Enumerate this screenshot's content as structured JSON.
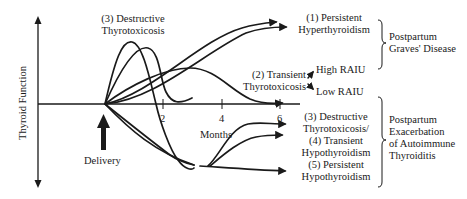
{
  "axes": {
    "y_label": "Thyroid Function",
    "x_label": "Months",
    "x_ticks": [
      "2",
      "4",
      "6"
    ],
    "event_label": "Delivery"
  },
  "curves": [
    {
      "id": "1",
      "label_line1": "(1) Persistent",
      "label_line2": "Hyperthyroidism"
    },
    {
      "id": "2",
      "label_line1": "(2) Transient",
      "label_line2": "Thyrotoxicosis"
    },
    {
      "id": "3top",
      "label_line1": "(3) Destructive",
      "label_line2": "Thyrotoxicosis"
    },
    {
      "id": "3",
      "label_line1": "(3) Destructive",
      "label_line2": "Thyrotoxicosis/"
    },
    {
      "id": "4",
      "label_line1": "(4) Transient",
      "label_line2": "Hypothyroidism"
    },
    {
      "id": "5",
      "label_line1": "(5) Persistent",
      "label_line2": "Hypothyroidism"
    }
  ],
  "raiu": {
    "high": "High RAIU",
    "low": "Low RAIU"
  },
  "groups": [
    {
      "name": "graves",
      "lines": [
        "Postpartum",
        "Graves' Disease"
      ]
    },
    {
      "name": "autoimmune",
      "lines": [
        "Postpartum",
        "Exacerbation",
        "of Autoimmune",
        "Thyroiditis"
      ]
    }
  ],
  "colors": {
    "line": "#1a1a1a",
    "background": "#ffffff"
  }
}
